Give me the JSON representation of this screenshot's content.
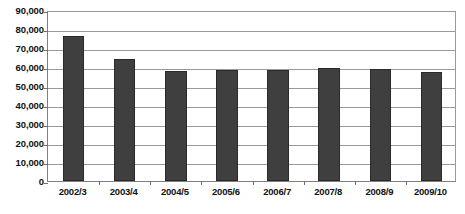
{
  "chart_data": {
    "type": "bar",
    "title": "",
    "subtitle": "",
    "xlabel": "",
    "ylabel": "",
    "categories": [
      "2002/3",
      "2003/4",
      "2004/5",
      "2005/6",
      "2006/7",
      "2007/8",
      "2008/9",
      "2009/10"
    ],
    "values": [
      76500,
      64000,
      58000,
      58200,
      58500,
      59500,
      59000,
      57500
    ],
    "series": [
      {
        "name": "",
        "values": [
          76500,
          64000,
          58000,
          58200,
          58500,
          59500,
          59000,
          57500
        ]
      }
    ],
    "ylim": [
      0,
      90000
    ],
    "y_tick_values": [
      90000,
      80000,
      70000,
      60000,
      50000,
      40000,
      30000,
      20000,
      10000,
      0
    ],
    "y_tick_labels": [
      "90,000",
      "80,000",
      "70,000",
      "60,000",
      "50,000",
      "40,000",
      "30,000",
      "20,000",
      "10,000",
      "0"
    ],
    "grid": "horizontal",
    "legend": "none",
    "legend_entries": [],
    "annotations": [],
    "bar_color": "#3f3f3f",
    "gridline_color": "#9a9a9a",
    "axis_color": "#808080",
    "background_color": "#ffffff"
  },
  "figure": {
    "bottom_cut_text": ""
  }
}
